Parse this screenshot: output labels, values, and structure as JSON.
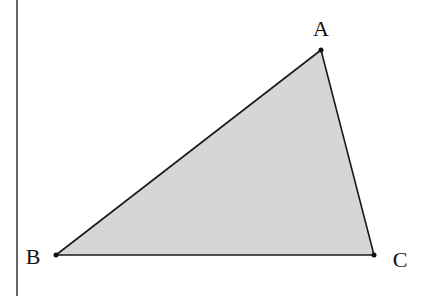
{
  "diagram": {
    "type": "triangle",
    "fill_color": "#d6d6d6",
    "stroke_color": "#1a1a1a",
    "margin_line_color": "#333333",
    "vertices": {
      "A": {
        "label": "A",
        "x": 321,
        "y": 50
      },
      "B": {
        "label": "B",
        "x": 56,
        "y": 255
      },
      "C": {
        "label": "C",
        "x": 374,
        "y": 255
      }
    }
  }
}
